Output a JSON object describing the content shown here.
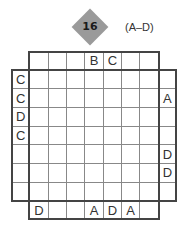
{
  "puzzle": {
    "number": "16",
    "letter_range": "(A–D)",
    "size": 7,
    "clues": {
      "top": [
        "",
        "",
        "",
        "B",
        "C",
        "",
        ""
      ],
      "left": [
        "C",
        "C",
        "D",
        "C",
        "",
        "",
        ""
      ],
      "right": [
        "",
        "A",
        "",
        "",
        "D",
        "D",
        ""
      ],
      "bottom": [
        "D",
        "",
        "",
        "A",
        "D",
        "A",
        ""
      ]
    },
    "inner_grid": [
      [
        "",
        "",
        "",
        "",
        "",
        "",
        ""
      ],
      [
        "",
        "",
        "",
        "",
        "",
        "",
        ""
      ],
      [
        "",
        "",
        "",
        "",
        "",
        "",
        ""
      ],
      [
        "",
        "",
        "",
        "",
        "",
        "",
        ""
      ],
      [
        "",
        "",
        "",
        "",
        "",
        "",
        ""
      ],
      [
        "",
        "",
        "",
        "",
        "",
        "",
        ""
      ],
      [
        "",
        "",
        "",
        "",
        "",
        "",
        ""
      ]
    ]
  },
  "colors": {
    "badge": "#9a9a9a",
    "grid_line": "#888888",
    "frame": "#444444"
  }
}
